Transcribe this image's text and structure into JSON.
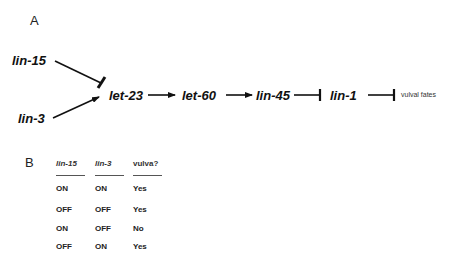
{
  "panel_a": {
    "label": "A",
    "nodes": {
      "lin15": "lin-15",
      "lin3": "lin-3",
      "let23": "let-23",
      "let60": "let-60",
      "lin45": "lin-45",
      "lin1": "lin-1",
      "vulval_fates": "vulval fates"
    },
    "edges": [
      {
        "from": "lin-15",
        "to": "let-23",
        "type": "inhibit"
      },
      {
        "from": "lin-3",
        "to": "let-23",
        "type": "activate"
      },
      {
        "from": "let-23",
        "to": "let-60",
        "type": "activate"
      },
      {
        "from": "let-60",
        "to": "lin-45",
        "type": "activate"
      },
      {
        "from": "lin-45",
        "to": "lin-1",
        "type": "inhibit"
      },
      {
        "from": "lin-1",
        "to": "vulval fates",
        "type": "inhibit"
      }
    ]
  },
  "panel_b": {
    "label": "B",
    "headers": [
      "lin-15",
      "lin-3",
      "vulva?"
    ],
    "rows": [
      [
        "ON",
        "ON",
        "Yes"
      ],
      [
        "OFF",
        "OFF",
        "Yes"
      ],
      [
        "ON",
        "OFF",
        "No"
      ],
      [
        "OFF",
        "ON",
        "Yes"
      ]
    ]
  }
}
